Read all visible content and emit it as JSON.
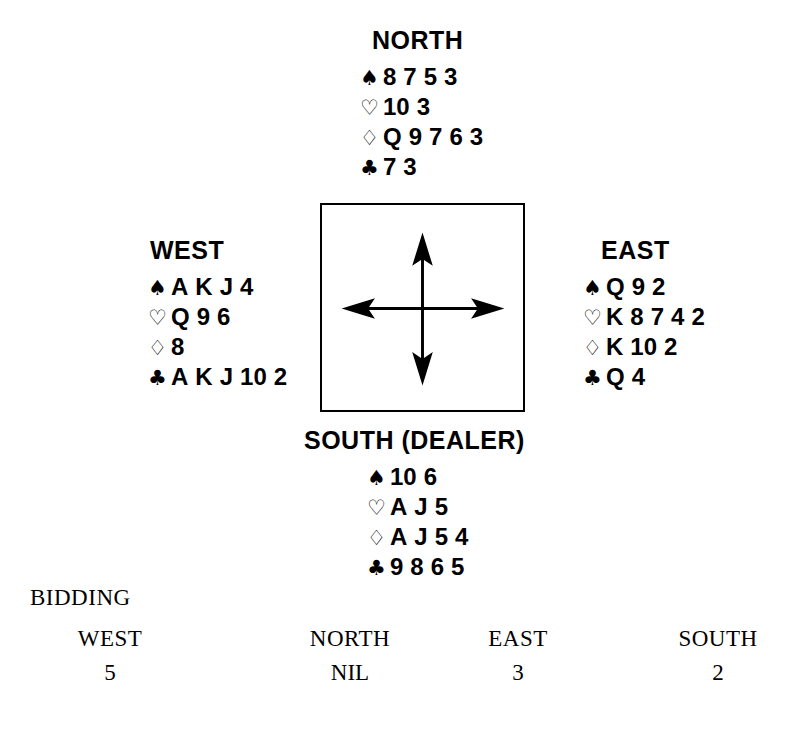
{
  "deal": {
    "north": {
      "label": "NORTH",
      "suits": [
        {
          "symbol": "♠",
          "name": "spade",
          "style": "solid",
          "cards": [
            "8",
            "7",
            "5",
            "3"
          ]
        },
        {
          "symbol": "♡",
          "name": "heart",
          "style": "hollow",
          "cards": [
            "10",
            "3"
          ]
        },
        {
          "symbol": "♢",
          "name": "diamond",
          "style": "hollow",
          "cards": [
            "Q",
            "9",
            "7",
            "6",
            "3"
          ]
        },
        {
          "symbol": "♣",
          "name": "club",
          "style": "solid",
          "cards": [
            "7",
            "3"
          ]
        }
      ]
    },
    "west": {
      "label": "WEST",
      "suits": [
        {
          "symbol": "♠",
          "name": "spade",
          "style": "solid",
          "cards": [
            "A",
            "K",
            "J",
            "4"
          ]
        },
        {
          "symbol": "♡",
          "name": "heart",
          "style": "hollow",
          "cards": [
            "Q",
            "9",
            "6"
          ]
        },
        {
          "symbol": "♢",
          "name": "diamond",
          "style": "hollow",
          "cards": [
            "8"
          ]
        },
        {
          "symbol": "♣",
          "name": "club",
          "style": "solid",
          "cards": [
            "A",
            "K",
            "J",
            "10",
            "2"
          ]
        }
      ]
    },
    "east": {
      "label": "EAST",
      "suits": [
        {
          "symbol": "♠",
          "name": "spade",
          "style": "solid",
          "cards": [
            "Q",
            "9",
            "2"
          ]
        },
        {
          "symbol": "♡",
          "name": "heart",
          "style": "hollow",
          "cards": [
            "K",
            "8",
            "7",
            "4",
            "2"
          ]
        },
        {
          "symbol": "♢",
          "name": "diamond",
          "style": "hollow",
          "cards": [
            "K",
            "10",
            "2"
          ]
        },
        {
          "symbol": "♣",
          "name": "club",
          "style": "solid",
          "cards": [
            "Q",
            "4"
          ]
        }
      ]
    },
    "south": {
      "label": "SOUTH (DEALER)",
      "suits": [
        {
          "symbol": "♠",
          "name": "spade",
          "style": "solid",
          "cards": [
            "10",
            "6"
          ]
        },
        {
          "symbol": "♡",
          "name": "heart",
          "style": "hollow",
          "cards": [
            "A",
            "J",
            "5"
          ]
        },
        {
          "symbol": "♢",
          "name": "diamond",
          "style": "hollow",
          "cards": [
            "A",
            "J",
            "5",
            "4"
          ]
        },
        {
          "symbol": "♣",
          "name": "club",
          "style": "solid",
          "cards": [
            "9",
            "8",
            "6",
            "5"
          ]
        }
      ]
    }
  },
  "compass": {
    "name": "compass-arrows",
    "directions": [
      "north",
      "east",
      "south",
      "west"
    ]
  },
  "bidding": {
    "title": "BIDDING",
    "columns": [
      {
        "seat": "WEST",
        "call": "5"
      },
      {
        "seat": "NORTH",
        "call": "NIL"
      },
      {
        "seat": "EAST",
        "call": "3"
      },
      {
        "seat": "SOUTH",
        "call": "2"
      }
    ]
  },
  "colors": {
    "ink": "#000000",
    "paper": "#ffffff"
  }
}
